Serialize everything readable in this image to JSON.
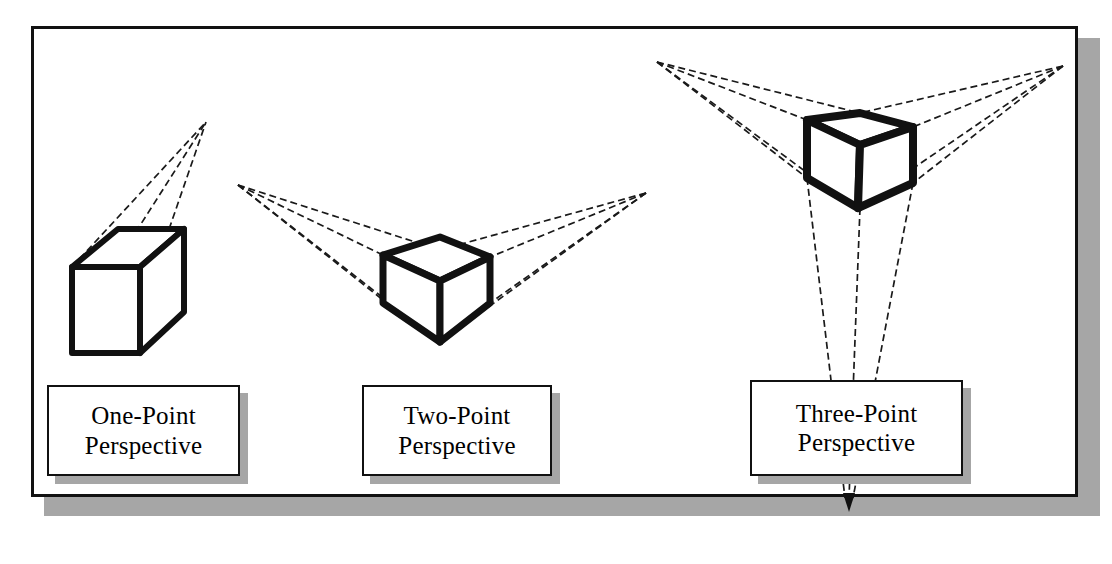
{
  "figure": {
    "background_color": "#ffffff",
    "ink_color": "#111111",
    "shadow_color": "#a6a6a6",
    "frame": {
      "border_color": "#111111",
      "border_width_px": 3,
      "has_drop_shadow": true
    }
  },
  "captions": [
    {
      "id": "one-point",
      "line1": "One-Point",
      "line2": "Perspective"
    },
    {
      "id": "two-point",
      "line1": "Two-Point",
      "line2": "Perspective"
    },
    {
      "id": "three-point",
      "line1": "Three-Point",
      "line2": "Perspective"
    }
  ],
  "diagrams": [
    {
      "name": "one-point-perspective",
      "vanishing_points": [
        {
          "label": "VP",
          "x": 206,
          "y": 122
        }
      ],
      "cube_style": "solid-heavy-outline",
      "construction_line_style": "dashed-thin"
    },
    {
      "name": "two-point-perspective",
      "vanishing_points": [
        {
          "label": "VP-left",
          "x": 238,
          "y": 185
        },
        {
          "label": "VP-right",
          "x": 646,
          "y": 193
        }
      ],
      "cube_style": "solid-heavy-outline",
      "construction_line_style": "dashed-thin"
    },
    {
      "name": "three-point-perspective",
      "vanishing_points": [
        {
          "label": "VP-left",
          "x": 657,
          "y": 62
        },
        {
          "label": "VP-right",
          "x": 1063,
          "y": 66
        },
        {
          "label": "VP-bottom",
          "x": 849,
          "y": 505
        }
      ],
      "cube_style": "solid-heavy-outline",
      "construction_line_style": "dashed-thin",
      "has_bottom_arrow": true
    }
  ]
}
